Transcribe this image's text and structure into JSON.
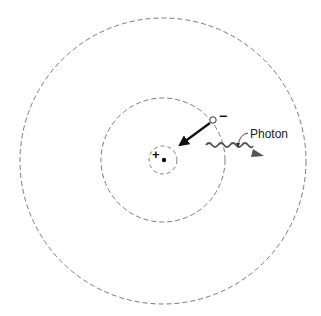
{
  "diagram": {
    "type": "bohr-atom",
    "labels": {
      "photon": "Photon",
      "nucleus_charge": "+",
      "electron_charge": "−"
    },
    "orbits": [
      {
        "name": "orbit-1",
        "cx": 163,
        "cy": 160,
        "r": 14
      },
      {
        "name": "orbit-2",
        "cx": 163,
        "cy": 160,
        "r": 62
      },
      {
        "name": "orbit-3",
        "cx": 163,
        "cy": 161,
        "r": 143
      }
    ],
    "colors": {
      "orbit": "#7a7a7a",
      "arrow": "#111111",
      "photon": "#555555"
    }
  }
}
